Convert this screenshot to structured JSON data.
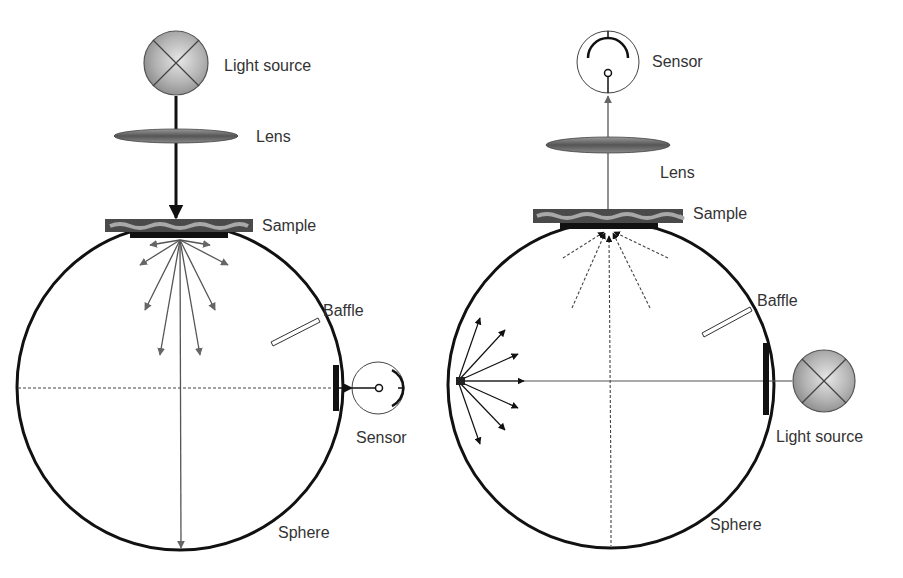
{
  "figure": {
    "type": "integrating-sphere-comparison",
    "left_panel": {
      "name": "reflectance-measurement",
      "labels": {
        "light_source": "Light source",
        "lens": "Lens",
        "sample": "Sample",
        "baffle": "Baffle",
        "sensor": "Sensor",
        "sphere": "Sphere"
      }
    },
    "right_panel": {
      "name": "transmittance-measurement",
      "labels": {
        "sensor": "Sensor",
        "lens": "Lens",
        "sample": "Sample",
        "baffle": "Baffle",
        "light_source": "Light source",
        "sphere": "Sphere"
      }
    }
  },
  "colors": {
    "outline": "#111111",
    "ray_gray": "#555555",
    "lens_fill": "#6a6a6a",
    "sample_fill": "#4a4a4a",
    "sample_wave": "#a8a8a8",
    "lamp_fill": "#b0b0b0",
    "text": "#333333"
  }
}
